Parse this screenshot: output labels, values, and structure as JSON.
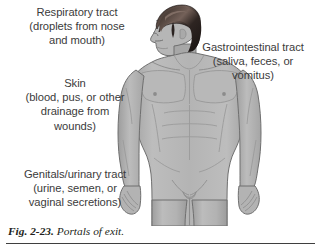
{
  "figure": {
    "caption_label": "Fig. 2-23.",
    "caption_title": "Portals of exit.",
    "colors": {
      "background": "#ffffff",
      "skin_fill": "#b0b0b0",
      "skin_shadow": "#9a9a9a",
      "skin_highlight": "#c4c4c4",
      "outline": "#6f6f6f",
      "hair_dark": "#241d1b",
      "hair_light": "#6b5a52",
      "text": "#3b3b3b",
      "caption_text": "#231f20",
      "rule": "#3f3f3f"
    }
  },
  "labels": {
    "respiratory": "Respiratory tract\n(droplets from nose\nand mouth)",
    "gastrointestinal": "Gastrointestinal tract\n(saliva, feces, or\nvomitus)",
    "skin": "Skin\n(blood, pus, or other\ndrainage from\nwounds)",
    "genitals": "Genitals/urinary tract\n(urine, semen, or\nvaginal secretions)"
  }
}
